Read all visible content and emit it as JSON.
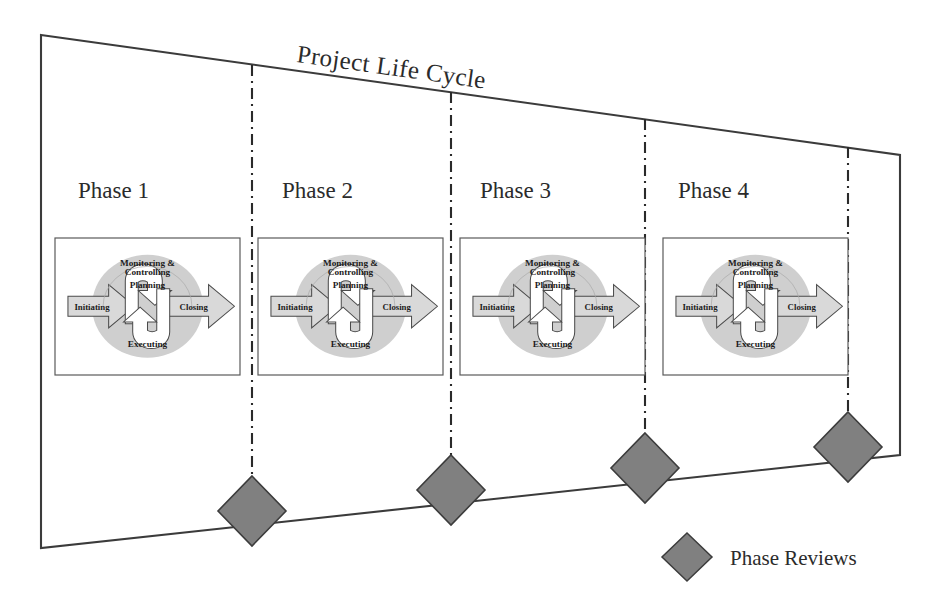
{
  "diagram": {
    "title": "Project Life Cycle",
    "type": "project-life-cycle-phase-diagram",
    "outline_color": "#3b3b3b",
    "divider_color": "#2a2a2a",
    "diamond_fill": "#808080",
    "diamond_stroke": "#3c3c3c",
    "circle_fill": "#cfcfcf",
    "arrow_fill": "#d9d9d9",
    "background": "#ffffff"
  },
  "phases": [
    {
      "label": "Phase 1"
    },
    {
      "label": "Phase 2"
    },
    {
      "label": "Phase 3"
    },
    {
      "label": "Phase 4"
    }
  ],
  "process_group": {
    "initiating": "Initiating",
    "planning": "Planning",
    "executing": "Executing",
    "closing": "Closing",
    "monitoring_line1": "Monitoring &",
    "monitoring_line2": "Controlling"
  },
  "legend": {
    "marker_shape": "diamond",
    "label": "Phase Reviews"
  },
  "phase_reviews": [
    {
      "name": "phase-review-1"
    },
    {
      "name": "phase-review-2"
    },
    {
      "name": "phase-review-3"
    },
    {
      "name": "phase-review-4"
    }
  ]
}
